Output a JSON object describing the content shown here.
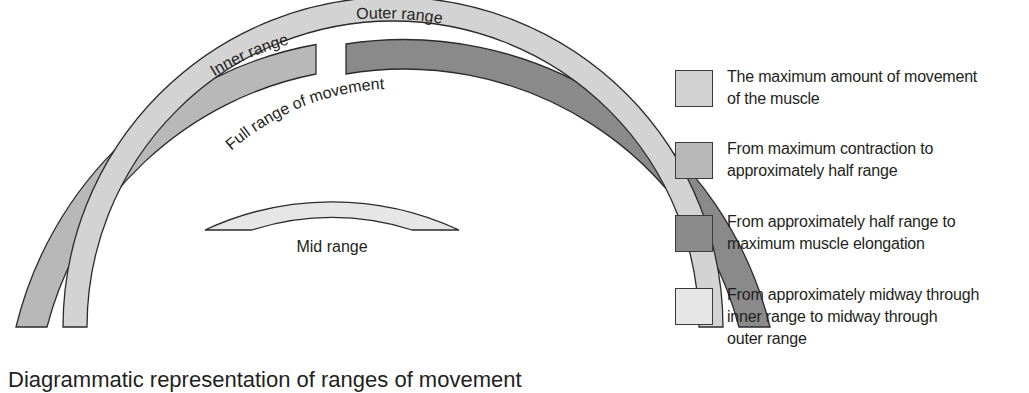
{
  "diagram": {
    "labels": {
      "inner_range": "Inner range",
      "outer_range": "Outer range",
      "full_range": "Full range of movement",
      "mid_range": "Mid range"
    },
    "colors": {
      "full_range": "#d3d3d3",
      "inner_range": "#b8b8b8",
      "outer_range": "#8a8a8a",
      "mid_range": "#e6e6e6",
      "stroke": "#2b2b2b"
    }
  },
  "legend": {
    "items": [
      {
        "key": "full_range",
        "color": "#d3d3d3",
        "text": "The maximum amount of movement of the muscle"
      },
      {
        "key": "inner_range",
        "color": "#b8b8b8",
        "text": "From maximum contraction to approximately half range"
      },
      {
        "key": "outer_range",
        "color": "#8a8a8a",
        "text": "From approximately half range to maximum muscle elongation"
      },
      {
        "key": "mid_range",
        "color": "#e6e6e6",
        "text": "From approximately midway through inner range to midway through outer range"
      }
    ],
    "lines": [
      [
        "The maximum amount of movement",
        "of the muscle"
      ],
      [
        "From maximum contraction to",
        "approximately half range"
      ],
      [
        "From approximately half range to",
        "maximum muscle elongation"
      ],
      [
        "From approximately midway through",
        "inner range to midway through",
        "outer range"
      ]
    ]
  },
  "caption": "Diagrammatic representation of ranges of movement"
}
